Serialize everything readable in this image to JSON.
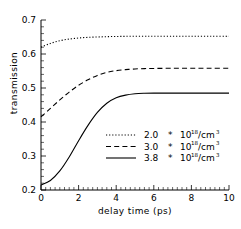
{
  "chart_data": {
    "type": "line",
    "title": "",
    "xlabel": "delay time (ps)",
    "ylabel": "transmission",
    "xlim": [
      0,
      10
    ],
    "ylim": [
      0.2,
      0.7
    ],
    "xticks": [
      "0",
      "2",
      "4",
      "6",
      "8",
      "10"
    ],
    "xtick_values": [
      0,
      2,
      4,
      6,
      8,
      10
    ],
    "yticks": [
      "0.2",
      "0.3",
      "0.4",
      "0.5",
      "0.6",
      "0.7"
    ],
    "ytick_values": [
      0.2,
      0.3,
      0.4,
      0.5,
      0.6,
      0.7
    ],
    "grid": false,
    "legend_position": "lower right",
    "x": [
      0,
      0.5,
      1,
      1.5,
      2,
      2.5,
      3,
      3.5,
      4,
      4.5,
      5,
      5.5,
      6,
      7,
      8,
      9,
      10
    ],
    "series": [
      {
        "name": "2.0 * 10^18 /cm^3",
        "density_value": "2.0",
        "density_mantissa_base": "10",
        "density_exponent": "18",
        "density_units": "/cm",
        "density_units_exponent": "3",
        "multiplier_symbol": "*",
        "style": "dotted",
        "color": "#000000",
        "values": [
          0.62,
          0.631,
          0.639,
          0.644,
          0.647,
          0.649,
          0.65,
          0.651,
          0.6515,
          0.652,
          0.652,
          0.652,
          0.652,
          0.652,
          0.652,
          0.652,
          0.652
        ]
      },
      {
        "name": "3.0 * 10^18 /cm^3",
        "density_value": "3.0",
        "density_mantissa_base": "10",
        "density_exponent": "18",
        "density_units": "/cm",
        "density_units_exponent": "3",
        "multiplier_symbol": "*",
        "style": "dashed",
        "color": "#000000",
        "values": [
          0.415,
          0.44,
          0.465,
          0.488,
          0.508,
          0.524,
          0.537,
          0.546,
          0.551,
          0.554,
          0.556,
          0.557,
          0.5575,
          0.558,
          0.558,
          0.558,
          0.558
        ]
      },
      {
        "name": "3.8 * 10^18 /cm^3",
        "density_value": "3.8",
        "density_mantissa_base": "10",
        "density_exponent": "18",
        "density_units": "/cm",
        "density_units_exponent": "3",
        "multiplier_symbol": "*",
        "style": "solid",
        "color": "#000000",
        "values": [
          0.215,
          0.228,
          0.256,
          0.297,
          0.345,
          0.39,
          0.428,
          0.455,
          0.471,
          0.479,
          0.483,
          0.4845,
          0.485,
          0.485,
          0.485,
          0.485,
          0.485
        ]
      }
    ]
  }
}
